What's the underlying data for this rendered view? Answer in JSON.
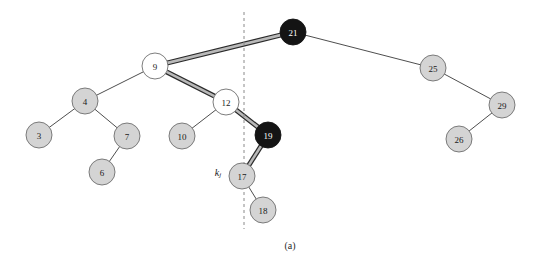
{
  "figure": {
    "caption": "(a)",
    "background_color": "#ffffff",
    "width": 539,
    "height": 265
  },
  "colors": {
    "node_gray_fill": "#d4d4d4",
    "node_white_fill": "#ffffff",
    "node_black_fill": "#141414",
    "node_stroke": "#6e6e6e",
    "edge_stroke": "#3a3a3a",
    "highlight_core": "#b9b9b9",
    "highlight_edge": "#2a2a2a",
    "dashed_line": "#8a8a8a",
    "label_dark": "#1a1a1a",
    "label_light": "#ffffff"
  },
  "annotations": {
    "key_label": "k",
    "key_subscript": "j",
    "key_label_x": 218,
    "key_label_y": 172
  },
  "divider": {
    "name": "vertical-dashed-divider",
    "x": 244,
    "y_top": 12,
    "y_bottom": 229,
    "dash_pattern": "3,3"
  },
  "tree": {
    "node_radius": 13,
    "nodes": [
      {
        "id": "n21",
        "label": "21",
        "cx": 293,
        "cy": 32,
        "fill": "black",
        "text": "light"
      },
      {
        "id": "n9",
        "label": "9",
        "cx": 155,
        "cy": 66,
        "fill": "white",
        "text": "dark"
      },
      {
        "id": "n25",
        "label": "25",
        "cx": 433,
        "cy": 68,
        "fill": "gray",
        "text": "dark"
      },
      {
        "id": "n4",
        "label": "4",
        "cx": 85,
        "cy": 101,
        "fill": "gray",
        "text": "dark"
      },
      {
        "id": "n12",
        "label": "12",
        "cx": 226,
        "cy": 102,
        "fill": "white",
        "text": "dark"
      },
      {
        "id": "n29",
        "label": "29",
        "cx": 502,
        "cy": 105,
        "fill": "gray",
        "text": "dark"
      },
      {
        "id": "n3",
        "label": "3",
        "cx": 39,
        "cy": 135,
        "fill": "gray",
        "text": "dark"
      },
      {
        "id": "n7",
        "label": "7",
        "cx": 127,
        "cy": 136,
        "fill": "gray",
        "text": "dark"
      },
      {
        "id": "n10",
        "label": "10",
        "cx": 182,
        "cy": 136,
        "fill": "gray",
        "text": "dark"
      },
      {
        "id": "n19",
        "label": "19",
        "cx": 268,
        "cy": 135,
        "fill": "black",
        "text": "light"
      },
      {
        "id": "n26",
        "label": "26",
        "cx": 459,
        "cy": 139,
        "fill": "gray",
        "text": "dark"
      },
      {
        "id": "n6",
        "label": "6",
        "cx": 102,
        "cy": 172,
        "fill": "gray",
        "text": "dark"
      },
      {
        "id": "n17",
        "label": "17",
        "cx": 242,
        "cy": 176,
        "fill": "gray",
        "text": "dark"
      },
      {
        "id": "n18",
        "label": "18",
        "cx": 263,
        "cy": 210,
        "fill": "gray",
        "text": "dark"
      }
    ],
    "edges": [
      {
        "id": "e21-9",
        "from": "n21",
        "to": "n9",
        "highlighted": true
      },
      {
        "id": "e21-25",
        "from": "n21",
        "to": "n25",
        "highlighted": false
      },
      {
        "id": "e9-4",
        "from": "n9",
        "to": "n4",
        "highlighted": false
      },
      {
        "id": "e9-12",
        "from": "n9",
        "to": "n12",
        "highlighted": true
      },
      {
        "id": "e4-3",
        "from": "n4",
        "to": "n3",
        "highlighted": false
      },
      {
        "id": "e4-7",
        "from": "n4",
        "to": "n7",
        "highlighted": false
      },
      {
        "id": "e7-6",
        "from": "n7",
        "to": "n6",
        "highlighted": false
      },
      {
        "id": "e12-10",
        "from": "n12",
        "to": "n10",
        "highlighted": false
      },
      {
        "id": "e12-19",
        "from": "n12",
        "to": "n19",
        "highlighted": true
      },
      {
        "id": "e19-17",
        "from": "n19",
        "to": "n17",
        "highlighted": true
      },
      {
        "id": "e17-18",
        "from": "n17",
        "to": "n18",
        "highlighted": false
      },
      {
        "id": "e25-29",
        "from": "n25",
        "to": "n29",
        "highlighted": false
      },
      {
        "id": "e29-26",
        "from": "n29",
        "to": "n26",
        "highlighted": false
      }
    ]
  }
}
